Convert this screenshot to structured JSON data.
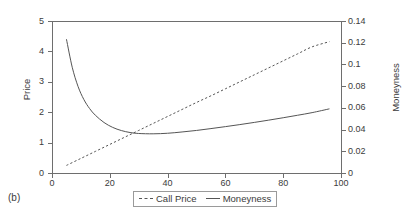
{
  "caption": "(b)",
  "legend": {
    "position": "below-plot",
    "entries": [
      {
        "label": "Call Price",
        "style": "dashed",
        "swatch": "dashed-line-swatch"
      },
      {
        "label": "Moneyness",
        "style": "solid",
        "swatch": "solid-line-swatch"
      }
    ]
  },
  "chart_data": {
    "type": "line",
    "title": "",
    "xlabel": "",
    "ylabel": "Price",
    "y2label": "Moneyness",
    "xlim": [
      0,
      100
    ],
    "ylim": [
      0,
      5
    ],
    "y2lim": [
      0,
      0.14
    ],
    "grid": false,
    "xticks": [
      0,
      20,
      40,
      60,
      80,
      100
    ],
    "xticklabels": [
      "0",
      "20",
      "40",
      "60",
      "80",
      "100"
    ],
    "yticks": [
      0,
      1,
      2,
      3,
      4,
      5
    ],
    "yticklabels": [
      "0",
      "1",
      "2",
      "3",
      "4",
      "5"
    ],
    "y2ticks": [
      0,
      0.02,
      0.04,
      0.06,
      0.08,
      0.1,
      0.12,
      0.14
    ],
    "y2ticklabels": [
      "0",
      "0.02",
      "0.04",
      "0.06",
      "0.08",
      "0.1",
      "0.12",
      "0.14"
    ],
    "legend_position": "below",
    "series": [
      {
        "name": "Call Price",
        "style": "dashed",
        "axis": "left",
        "x": [
          5,
          10,
          15,
          20,
          25,
          30,
          35,
          40,
          45,
          50,
          55,
          60,
          65,
          70,
          75,
          80,
          85,
          90,
          96
        ],
        "values": [
          0.25,
          0.48,
          0.71,
          0.94,
          1.17,
          1.4,
          1.63,
          1.86,
          2.09,
          2.32,
          2.54,
          2.77,
          3.0,
          3.23,
          3.46,
          3.69,
          3.92,
          4.15,
          4.32
        ]
      },
      {
        "name": "Moneyness",
        "style": "solid",
        "axis": "right",
        "x": [
          5,
          7,
          9,
          11,
          13,
          15,
          18,
          21,
          24,
          27,
          30,
          35,
          40,
          45,
          50,
          55,
          60,
          65,
          70,
          75,
          80,
          85,
          90,
          96
        ],
        "values": [
          0.1232,
          0.0974,
          0.0798,
          0.0678,
          0.0594,
          0.0532,
          0.0465,
          0.042,
          0.0391,
          0.0373,
          0.0364,
          0.0361,
          0.0366,
          0.0378,
          0.0392,
          0.0409,
          0.0427,
          0.0446,
          0.0466,
          0.0487,
          0.0509,
          0.0532,
          0.0556,
          0.0591
        ],
        "values_on_left_axis": [
          4.4,
          3.48,
          2.85,
          2.42,
          2.12,
          1.9,
          1.66,
          1.5,
          1.4,
          1.33,
          1.3,
          1.29,
          1.31,
          1.35,
          1.4,
          1.46,
          1.53,
          1.59,
          1.66,
          1.74,
          1.82,
          1.9,
          1.99,
          2.11
        ]
      }
    ]
  }
}
